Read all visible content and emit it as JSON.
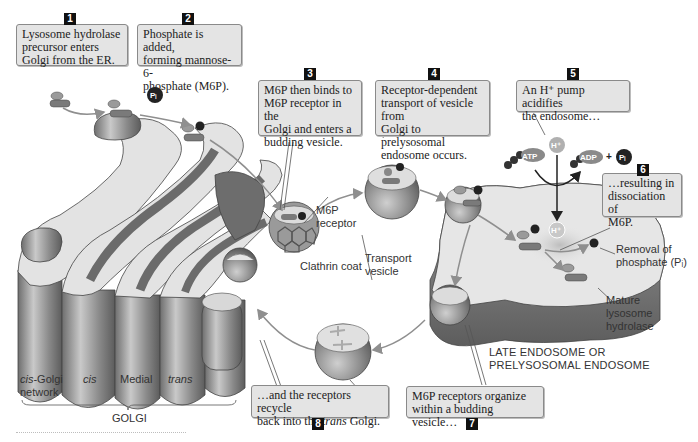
{
  "callouts": [
    {
      "number": "1",
      "text": "Lysosome hydrolase\nprecursor enters\nGolgi from the ER."
    },
    {
      "number": "2",
      "text": "Phosphate is added,\nforming mannose-6-\nphosphate (M6P)."
    },
    {
      "number": "3",
      "text": "M6P then binds to\nM6P receptor in the\nGolgi and enters a\nbudding vesicle."
    },
    {
      "number": "4",
      "text": "Receptor-dependent\ntransport of vesicle from\nGolgi to prelysosomal\nendosome occurs."
    },
    {
      "number": "5",
      "text": "An H⁺ pump acidifies\nthe endosome…"
    },
    {
      "number": "6",
      "text": "…resulting in\ndissociation of\nM6P."
    },
    {
      "number": "7",
      "text": "M6P receptors organize\nwithin a budding vesicle…"
    },
    {
      "number": "8",
      "text_before": "…and the receptors recycle\nback into the ",
      "text_italic": "trans",
      "text_after": " Golgi."
    }
  ],
  "labels": {
    "m6p_receptor": "M6P\nreceptor",
    "clathrin_coat": "Clathrin coat",
    "transport_vesicle": "Transport\nvesicle",
    "removal_of_phosphate": "Removal of\nphosphate (Pᵢ)",
    "mature_hydrolase": "Mature\nlysosome\nhydrolase",
    "late_endosome": "LATE ENDOSOME OR\nPRELYSOSOMAL ENDOSOME",
    "golgi": "GOLGI",
    "cis_golgi_network_italic": "cis",
    "cis_golgi_network_rest": "-Golgi\nnetwork",
    "cis": "cis",
    "medial": "Medial",
    "trans": "trans"
  },
  "molecules": {
    "phosphate": "P",
    "inorganic_phosphate": "Pᵢ",
    "proton": "H⁺",
    "atp": "ATP",
    "adp": "ADP",
    "plus": "+"
  },
  "colors": {
    "callout_bg": "#e4e4e4",
    "callout_border": "#8a8a8a",
    "badge": "#111111",
    "membrane_dark": "#7a7a7a",
    "membrane_light": "#e6e6e6",
    "arrow": "#8f8f8f"
  }
}
